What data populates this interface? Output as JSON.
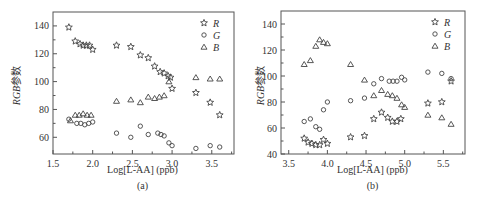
{
  "figure": {
    "panels": [
      {
        "id": "a",
        "sublabel": "(a)",
        "xlabel": "Log[L-AA] (ppb)",
        "ylabel_italic": "RGB",
        "ylabel_suffix": "参数"
      },
      {
        "id": "b",
        "sublabel": "(b)",
        "xlabel": "Log[L-AA] (ppb)",
        "ylabel_italic": "RGB",
        "ylabel_suffix": "参数"
      }
    ]
  },
  "chart_data": [
    {
      "type": "scatter",
      "title": "(a)",
      "xlabel": "Log[L-AA] (ppb)",
      "ylabel": "RGB参数",
      "xlim": [
        1.5,
        3.78
      ],
      "ylim": [
        48,
        150
      ],
      "xticks": [
        1.5,
        2.0,
        2.5,
        3.0,
        3.5
      ],
      "xtick_labels": [
        "1.5",
        "2.0",
        "2.5",
        "3.0",
        "3.5"
      ],
      "yticks": [
        60,
        80,
        100,
        120,
        140
      ],
      "ytick_labels": [
        "60",
        "80",
        "100",
        "120",
        "140"
      ],
      "grid": false,
      "legend_position": "upper right",
      "frame": {
        "left": 53,
        "top": 12,
        "right": 234,
        "bottom": 154
      },
      "series": [
        {
          "name": "R",
          "marker": "star",
          "x": [
            1.7,
            1.78,
            1.84,
            1.88,
            1.92,
            1.96,
            2.0,
            2.3,
            2.48,
            2.6,
            2.7,
            2.78,
            2.85,
            2.9,
            2.95,
            2.98,
            3.0,
            3.3,
            3.48,
            3.6
          ],
          "y": [
            139,
            129,
            127,
            126,
            126,
            126,
            123,
            126,
            125,
            119,
            117,
            111,
            107,
            106,
            104,
            103,
            95,
            92,
            85,
            76
          ]
        },
        {
          "name": "G",
          "marker": "circle",
          "x": [
            1.7,
            1.8,
            1.85,
            1.9,
            1.95,
            2.0,
            2.3,
            2.48,
            2.6,
            2.7,
            2.82,
            2.86,
            2.9,
            2.96,
            3.0,
            3.3,
            3.48,
            3.6
          ],
          "y": [
            73,
            70,
            70,
            69,
            70,
            71,
            63,
            60,
            68,
            62,
            63,
            62,
            61,
            56,
            54,
            52,
            54,
            53
          ]
        },
        {
          "name": "B",
          "marker": "triangle",
          "x": [
            1.72,
            1.78,
            1.83,
            1.88,
            1.93,
            1.98,
            2.3,
            2.48,
            2.6,
            2.7,
            2.78,
            2.84,
            2.9,
            2.96,
            3.3,
            3.48,
            3.6
          ],
          "y": [
            72,
            76,
            76,
            77,
            76,
            76,
            86,
            87,
            85,
            89,
            88,
            89,
            90,
            100,
            103,
            102,
            102
          ]
        }
      ]
    },
    {
      "type": "scatter",
      "title": "(b)",
      "xlabel": "Log[L-AA] (ppb)",
      "ylabel": "RGB参数",
      "xlim": [
        3.4,
        5.78
      ],
      "ylim": [
        40,
        150
      ],
      "xticks": [
        3.5,
        4.0,
        4.5,
        5.0,
        5.5
      ],
      "xtick_labels": [
        "3.5",
        "4.0",
        "4.5",
        "5.0",
        "5.5"
      ],
      "yticks": [
        40,
        60,
        80,
        100,
        120,
        140
      ],
      "ytick_labels": [
        "40",
        "60",
        "80",
        "100",
        "120",
        "140"
      ],
      "grid": false,
      "legend_position": "upper right",
      "frame": {
        "left": 281,
        "top": 11,
        "right": 465,
        "bottom": 154
      },
      "series": [
        {
          "name": "R",
          "marker": "star",
          "x": [
            3.7,
            3.75,
            3.8,
            3.85,
            3.9,
            3.95,
            4.0,
            4.3,
            4.48,
            4.6,
            4.7,
            4.78,
            4.84,
            4.9,
            4.95,
            5.3,
            5.48,
            5.6
          ],
          "y": [
            52,
            49,
            48,
            47,
            47,
            51,
            48,
            53,
            54,
            67,
            72,
            68,
            65,
            65,
            67,
            79,
            80,
            96
          ]
        },
        {
          "name": "G",
          "marker": "circle",
          "x": [
            3.7,
            3.78,
            3.85,
            3.9,
            3.95,
            4.0,
            4.3,
            4.48,
            4.6,
            4.7,
            4.8,
            4.85,
            4.9,
            4.96,
            5.0,
            5.3,
            5.48,
            5.6
          ],
          "y": [
            65,
            67,
            61,
            59,
            74,
            80,
            81,
            83,
            94,
            98,
            96,
            96,
            96,
            99,
            97,
            103,
            102,
            98
          ]
        },
        {
          "name": "B",
          "marker": "triangle",
          "x": [
            3.7,
            3.78,
            3.85,
            3.9,
            3.95,
            4.0,
            4.3,
            4.48,
            4.6,
            4.7,
            4.78,
            4.84,
            4.9,
            4.96,
            5.0,
            5.3,
            5.48,
            5.6
          ],
          "y": [
            109,
            112,
            123,
            128,
            126,
            125,
            109,
            97,
            85,
            89,
            86,
            85,
            83,
            78,
            76,
            70,
            68,
            63
          ]
        }
      ]
    }
  ],
  "colors": {
    "axis": "#555555",
    "marker": "#444444",
    "text": "#333333"
  }
}
